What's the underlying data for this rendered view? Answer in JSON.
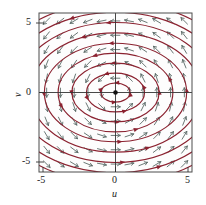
{
  "figure": {
    "name": "phase-portrait-direction-field",
    "background": "#ffffff",
    "frame_color": "#4d4d4d",
    "axis_color": "#333333",
    "trajectory_color": "#8b2230",
    "arrow_color": "#5a6a66",
    "equilibrium_color": "#111111"
  },
  "axes": {
    "xlabel": "u",
    "ylabel": "v",
    "xticks": [
      "-5",
      "0",
      "5"
    ],
    "yticks": [
      "5",
      "0",
      "-5"
    ],
    "xlim": [
      -5,
      5
    ],
    "ylim": [
      -5,
      5
    ]
  },
  "chart_data": {
    "type": "scatter",
    "title": "",
    "xlabel": "u",
    "ylabel": "v",
    "xlim": [
      -5,
      5
    ],
    "ylim": [
      -5,
      5
    ],
    "xticks": [
      -5,
      0,
      5
    ],
    "yticks": [
      -5,
      0,
      5
    ],
    "grid": false,
    "legend": null,
    "plot_kind": "phase-portrait-with-direction-field",
    "equilibrium_points": [
      {
        "u": 0,
        "v": 0,
        "type": "center"
      }
    ],
    "flow_direction": "counterclockwise",
    "system": {
      "du_dt": "-a*v",
      "dv_dt": "b*u",
      "description": "linear center; closed elliptical orbits about the origin"
    },
    "trajectories": [
      {
        "semi_major_u": 0.95,
        "semi_minor_v": 0.6
      },
      {
        "semi_major_u": 1.9,
        "semi_minor_v": 1.22
      },
      {
        "semi_major_u": 2.85,
        "semi_minor_v": 1.85
      },
      {
        "semi_major_u": 3.75,
        "semi_minor_v": 2.48
      },
      {
        "semi_major_u": 4.65,
        "semi_minor_v": 3.1
      },
      {
        "semi_major_u": 5.6,
        "semi_minor_v": 3.75
      },
      {
        "semi_major_u": 6.5,
        "semi_minor_v": 4.4
      },
      {
        "semi_major_u": 7.45,
        "semi_minor_v": 5.05
      },
      {
        "semi_major_u": 8.4,
        "semi_minor_v": 5.7
      }
    ],
    "direction_field": {
      "grid_u": [
        -4.5,
        -3.6,
        -2.7,
        -1.8,
        -0.9,
        0.0,
        0.9,
        1.8,
        2.7,
        3.6,
        4.5
      ],
      "grid_v": [
        -4.5,
        -3.6,
        -2.7,
        -1.8,
        -0.9,
        0.0,
        0.9,
        1.8,
        2.7,
        3.6,
        4.5
      ],
      "vector_rule": "(du,dv) proportional to (-v, u) normalized",
      "arrow_style": "open barbed arrowhead"
    }
  }
}
